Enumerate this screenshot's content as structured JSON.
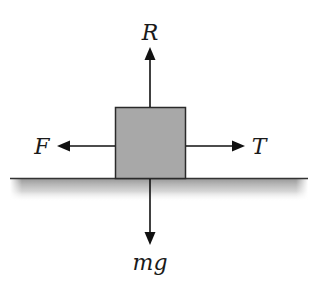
{
  "diagram": {
    "forces": [
      {
        "id": "normal",
        "label": "R",
        "direction": "up"
      },
      {
        "id": "friction",
        "label": "F",
        "direction": "left"
      },
      {
        "id": "tension",
        "label": "T",
        "direction": "right"
      },
      {
        "id": "weight",
        "label": "mg",
        "direction": "down"
      }
    ],
    "block": {
      "fill": "#a8a8a8",
      "stroke": "#2a2a2a"
    },
    "ground": {
      "line_color": "#333333",
      "shadow_color": "#9a9a9a"
    },
    "arrow_color": "#111111"
  }
}
